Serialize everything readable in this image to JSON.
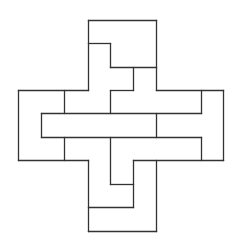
{
  "diagram": {
    "type": "polyomino-dissection",
    "width": 237,
    "height": 249,
    "stroke_color": "#333333",
    "background": "#ffffff",
    "segments": [
      [
        88,
        20,
        156,
        20
      ],
      [
        88,
        20,
        88,
        90
      ],
      [
        156,
        20,
        156,
        90
      ],
      [
        88,
        43,
        110,
        43
      ],
      [
        110,
        43,
        110,
        67
      ],
      [
        110,
        67,
        156,
        67
      ],
      [
        133,
        67,
        133,
        90
      ],
      [
        110,
        90,
        133,
        90
      ],
      [
        110,
        90,
        110,
        113
      ],
      [
        18,
        90,
        88,
        90
      ],
      [
        156,
        90,
        223,
        90
      ],
      [
        18,
        90,
        18,
        160
      ],
      [
        223,
        90,
        223,
        160
      ],
      [
        64,
        90,
        64,
        113
      ],
      [
        201,
        90,
        201,
        113
      ],
      [
        41,
        113,
        201,
        113
      ],
      [
        41,
        113,
        41,
        137
      ],
      [
        41,
        137,
        201,
        137
      ],
      [
        156,
        113,
        156,
        137
      ],
      [
        201,
        137,
        201,
        160
      ],
      [
        64,
        137,
        64,
        160
      ],
      [
        110,
        137,
        110,
        184
      ],
      [
        18,
        160,
        88,
        160
      ],
      [
        133,
        160,
        223,
        160
      ],
      [
        88,
        160,
        88,
        231
      ],
      [
        156,
        160,
        156,
        231
      ],
      [
        133,
        160,
        133,
        207
      ],
      [
        110,
        184,
        133,
        184
      ],
      [
        88,
        207,
        133,
        207
      ],
      [
        88,
        231,
        156,
        231
      ]
    ]
  }
}
